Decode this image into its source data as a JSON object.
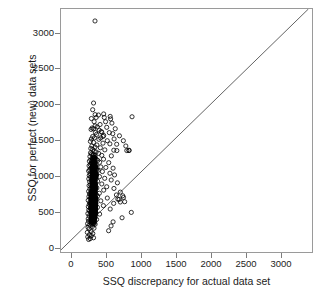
{
  "chart_data": {
    "type": "scatter",
    "title": "",
    "xlabel": "SSQ discrepancy for actual data set",
    "ylabel": "SSQ for perfect (new) data sets",
    "xlim": [
      -120,
      3350
    ],
    "ylim": [
      -150,
      3300
    ],
    "xticks": [
      0,
      500,
      1000,
      1500,
      2000,
      2500,
      3000
    ],
    "yticks": [
      0,
      500,
      1000,
      1500,
      2000,
      2500,
      3000
    ],
    "xtick_labels": [
      "0",
      "500",
      "1000",
      "1500",
      "2000",
      "2500",
      "3000"
    ],
    "ytick_labels": [
      "0",
      "500",
      "1000",
      "1500",
      "2000",
      "2500",
      "3000"
    ],
    "grid": false,
    "legend": "none",
    "marker": {
      "shape": "circle",
      "filled": false,
      "edge_color": "#000000",
      "size_px": 4.2,
      "line_width": 0.8
    },
    "reference_line": {
      "type": "identity",
      "label": "y = x",
      "color": "#3a3a3a",
      "width": 0.8,
      "from": [
        -120,
        -120
      ],
      "to": [
        3300,
        3300
      ]
    },
    "annotations": [
      {
        "text": "extreme outlier",
        "x": 350,
        "y": 3130
      }
    ],
    "series": [
      {
        "name": "SSQ comparison",
        "n_points": 2400,
        "cluster": {
          "description": "dense vertical band of open circles",
          "x_range": [
            250,
            460
          ],
          "y_range": [
            10,
            1320
          ],
          "x_mode": 320,
          "y_mode": 480,
          "n": 2150
        },
        "outliers": [
          [
            350,
            3130
          ],
          [
            330,
            1965
          ],
          [
            318,
            1870
          ],
          [
            352,
            1800
          ],
          [
            398,
            1795
          ],
          [
            470,
            1810
          ],
          [
            366,
            1760
          ],
          [
            300,
            1745
          ],
          [
            560,
            1775
          ],
          [
            338,
            1700
          ],
          [
            420,
            1660
          ],
          [
            352,
            1640
          ],
          [
            382,
            1625
          ],
          [
            310,
            1610
          ],
          [
            330,
            1600
          ],
          [
            296,
            1590
          ],
          [
            408,
            1580
          ],
          [
            436,
            1560
          ],
          [
            356,
            1545
          ],
          [
            372,
            1520
          ],
          [
            470,
            1505
          ],
          [
            318,
            1490
          ],
          [
            342,
            1470
          ],
          [
            300,
            1455
          ],
          [
            404,
            1450
          ],
          [
            520,
            1430
          ],
          [
            286,
            1420
          ],
          [
            330,
            1405
          ],
          [
            460,
            1395
          ],
          [
            556,
            1385
          ],
          [
            376,
            1370
          ],
          [
            306,
            1355
          ],
          [
            350,
            1340
          ],
          [
            424,
            1330
          ],
          [
            292,
            1320
          ],
          [
            318,
            1305
          ],
          [
            486,
            1300
          ],
          [
            610,
            1295
          ],
          [
            652,
            1290
          ],
          [
            340,
            1280
          ],
          [
            366,
            1270
          ],
          [
            288,
            1258
          ],
          [
            400,
            1250
          ],
          [
            300,
            1240
          ],
          [
            322,
            1230
          ],
          [
            444,
            1222
          ],
          [
            576,
            1215
          ],
          [
            280,
            1205
          ],
          [
            352,
            1195
          ],
          [
            310,
            1185
          ],
          [
            336,
            1176
          ],
          [
            468,
            1168
          ],
          [
            292,
            1158
          ],
          [
            388,
            1150
          ],
          [
            272,
            1140
          ],
          [
            318,
            1132
          ],
          [
            414,
            1124
          ],
          [
            540,
            1118
          ],
          [
            300,
            1108
          ],
          [
            346,
            1100
          ],
          [
            284,
            1092
          ],
          [
            368,
            1082
          ],
          [
            268,
            1074
          ],
          [
            310,
            1066
          ],
          [
            430,
            1058
          ],
          [
            500,
            1050
          ],
          [
            600,
            1040
          ],
          [
            290,
            1032
          ],
          [
            334,
            1024
          ],
          [
            276,
            1016
          ],
          [
            392,
            1008
          ],
          [
            262,
            1000
          ],
          [
            452,
            992
          ],
          [
            308,
            984
          ],
          [
            346,
            976
          ],
          [
            556,
            968
          ],
          [
            284,
            960
          ],
          [
            372,
            952
          ],
          [
            620,
            944
          ],
          [
            270,
            936
          ],
          [
            318,
            928
          ],
          [
            412,
            920
          ],
          [
            290,
            912
          ],
          [
            352,
            904
          ],
          [
            484,
            896
          ],
          [
            264,
            888
          ],
          [
            330,
            880
          ],
          [
            574,
            872
          ],
          [
            300,
            864
          ],
          [
            386,
            856
          ],
          [
            276,
            848
          ],
          [
            340,
            840
          ],
          [
            660,
            832
          ],
          [
            310,
            824
          ],
          [
            444,
            816
          ],
          [
            286,
            808
          ],
          [
            358,
            800
          ],
          [
            268,
            792
          ],
          [
            322,
            784
          ],
          [
            512,
            776
          ],
          [
            296,
            768
          ],
          [
            376,
            760
          ],
          [
            612,
            752
          ],
          [
            280,
            744
          ],
          [
            338,
            736
          ],
          [
            470,
            728
          ],
          [
            304,
            720
          ],
          [
            262,
            712
          ],
          [
            354,
            704
          ],
          [
            700,
            700
          ],
          [
            290,
            692
          ],
          [
            410,
            684
          ],
          [
            274,
            676
          ],
          [
            330,
            668
          ],
          [
            646,
            660
          ],
          [
            312,
            652
          ],
          [
            386,
            644
          ],
          [
            266,
            636
          ],
          [
            348,
            628
          ],
          [
            744,
            624
          ],
          [
            298,
            620
          ],
          [
            520,
            616
          ],
          [
            282,
            608
          ],
          [
            368,
            600
          ],
          [
            684,
            596
          ],
          [
            320,
            592
          ],
          [
            256,
            584
          ],
          [
            430,
            576
          ],
          [
            302,
            568
          ],
          [
            760,
            564
          ],
          [
            278,
            556
          ],
          [
            356,
            548
          ],
          [
            608,
            540
          ],
          [
            292,
            532
          ],
          [
            270,
            524
          ],
          [
            336,
            516
          ],
          [
            466,
            508
          ],
          [
            310,
            500
          ],
          [
            258,
            492
          ],
          [
            384,
            484
          ],
          [
            286,
            476
          ],
          [
            328,
            468
          ],
          [
            560,
            460
          ],
          [
            300,
            452
          ],
          [
            264,
            444
          ],
          [
            350,
            436
          ],
          [
            276,
            428
          ],
          [
            852,
            412
          ],
          [
            312,
            404
          ],
          [
            252,
            396
          ],
          [
            414,
            388
          ],
          [
            294,
            380
          ],
          [
            340,
            372
          ],
          [
            268,
            364
          ],
          [
            724,
            336
          ],
          [
            304,
            328
          ],
          [
            256,
            320
          ],
          [
            372,
            312
          ],
          [
            284,
            304
          ],
          [
            326,
            296
          ],
          [
            262,
            288
          ],
          [
            600,
            278
          ],
          [
            298,
            264
          ],
          [
            248,
            252
          ],
          [
            352,
            244
          ],
          [
            278,
            232
          ],
          [
            572,
            220
          ],
          [
            314,
            212
          ],
          [
            254,
            200
          ],
          [
            336,
            188
          ],
          [
            268,
            176
          ],
          [
            538,
            152
          ],
          [
            296,
            140
          ],
          [
            244,
            128
          ],
          [
            320,
            112
          ],
          [
            272,
            96
          ],
          [
            300,
            80
          ],
          [
            250,
            64
          ],
          [
            330,
            52
          ],
          [
            284,
            40
          ],
          [
            262,
            28
          ],
          [
            666,
            600
          ],
          [
            700,
            560
          ],
          [
            734,
            648
          ],
          [
            790,
            1290
          ],
          [
            820,
            1295
          ],
          [
            776,
            1355
          ],
          [
            742,
            1430
          ],
          [
            688,
            1500
          ],
          [
            650,
            1380
          ],
          [
            614,
            1455
          ],
          [
            596,
            1530
          ],
          [
            630,
            1600
          ],
          [
            584,
            1680
          ],
          [
            566,
            1740
          ],
          [
            548,
            1545
          ],
          [
            512,
            1620
          ],
          [
            496,
            1700
          ],
          [
            478,
            1760
          ],
          [
            462,
            1490
          ],
          [
            444,
            1550
          ],
          [
            428,
            1470
          ],
          [
            862,
            1770
          ],
          [
            820,
            1290
          ]
        ]
      }
    ]
  }
}
